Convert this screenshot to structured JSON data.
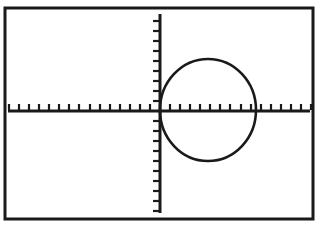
{
  "screen": {
    "device_label": "graphing-calculator-screen",
    "background_color": "#ffffff",
    "ink_color": "#1a1a1a",
    "frame": {
      "x": 5,
      "y": 8,
      "width": 308,
      "height": 211,
      "stroke_width": 3
    }
  },
  "chart_data": {
    "type": "line",
    "title": "",
    "subtitle": "",
    "xlabel": "",
    "ylabel": "",
    "grid": false,
    "legend": null,
    "legend_position": "none",
    "annotations": [],
    "axes": {
      "x_axis": {
        "label": "",
        "pixel_y": 111,
        "pixel_x_start": 8,
        "pixel_x_end": 310,
        "xlim": [
          -7.8,
          7.8
        ],
        "tick_interval": 0.5,
        "tick_count": 31,
        "tick_labels": [],
        "tick_direction": "up",
        "tick_length": 6
      },
      "y_axis": {
        "label": "",
        "pixel_x": 160,
        "pixel_y_start": 14,
        "pixel_y_end": 213,
        "ylim": [
          -5.2,
          5.2
        ],
        "tick_interval": 0.5,
        "tick_count": 21,
        "tick_labels": [],
        "tick_direction": "left",
        "tick_length": 6
      }
    },
    "series": [
      {
        "name": "circle",
        "shape": "circle",
        "description": "circle tangent to the y-axis at the origin, lying entirely in the positive-x half plane",
        "center": {
          "x": 2.5,
          "y": 0.0
        },
        "radius": 2.5,
        "center_pixel": {
          "x": 208,
          "y": 110
        },
        "radius_pixel_x": 48,
        "radius_pixel_y": 51,
        "x_intercepts": [
          0.0,
          5.0
        ],
        "y_intercepts": [
          0.0
        ],
        "extent_x": [
          0.0,
          5.0
        ],
        "extent_y": [
          -2.5,
          2.5
        ],
        "extent_pixel_x": [
          160,
          256
        ],
        "extent_pixel_y": [
          59,
          162
        ],
        "stroke_color": "#1a1a1a",
        "stroke_width": 2.6,
        "fill": "none"
      }
    ]
  }
}
